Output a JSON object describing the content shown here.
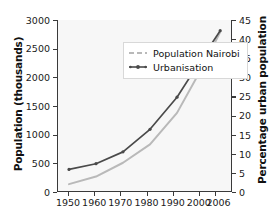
{
  "chart_data": {
    "type": "line",
    "title": "",
    "xlabel": "",
    "ylabel": "Population (thousands)",
    "ylabel_right": "Percentage urban population",
    "grid": false,
    "legend_position": "upper-left-inside",
    "x": [
      1950,
      1960,
      1970,
      1980,
      1990,
      2000,
      2006
    ],
    "categories": [
      "1950",
      "1960",
      "1970",
      "1980",
      "1990",
      "2000",
      "2006"
    ],
    "ylim": [
      0,
      3000
    ],
    "ylim_right": [
      0,
      45
    ],
    "yticks": [
      0,
      500,
      1000,
      1500,
      2000,
      2500,
      3000
    ],
    "yticks_right": [
      0,
      5,
      10,
      15,
      20,
      25,
      30,
      35,
      40,
      45
    ],
    "series": [
      {
        "name": "Population Nairobi",
        "axis": "left",
        "color": "#b9b9b9",
        "values": [
          137,
          270,
          510,
          830,
          1380,
          2230,
          2790
        ]
      },
      {
        "name": "Urbanisation",
        "axis": "right",
        "color": "#4a4a4a",
        "values": [
          5.9,
          7.4,
          10.5,
          16.4,
          24.8,
          35.8,
          42.2
        ]
      }
    ]
  },
  "axes": {
    "left": {
      "title": "Population (thousands)",
      "ticks": [
        "3000",
        "2500",
        "2000",
        "1500",
        "1000",
        "500",
        "0"
      ]
    },
    "right": {
      "title": "Percentage urban population",
      "ticks": [
        "45",
        "40",
        "35",
        "30",
        "25",
        "20",
        "15",
        "10",
        "5",
        "0"
      ]
    },
    "bottom": {
      "ticks": [
        "1950",
        "1960",
        "1970",
        "1980",
        "1990",
        "2000",
        "2006"
      ]
    }
  },
  "legend": {
    "items": [
      {
        "label": "Population Nairobi",
        "color": "#b9b9b9",
        "marker": "line-with-dashes"
      },
      {
        "label": "Urbanisation",
        "color": "#4a4a4a",
        "marker": "line-with-markers"
      }
    ]
  }
}
